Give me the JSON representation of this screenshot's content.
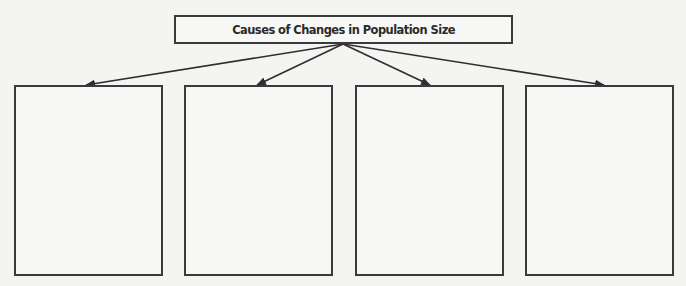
{
  "diagram": {
    "title": "Causes of Changes in Population Size",
    "colors": {
      "background": "#f4f4f2",
      "stroke": "#3a3a3a",
      "text": "#2a2a2a"
    },
    "boxes": [
      {
        "label": ""
      },
      {
        "label": ""
      },
      {
        "label": ""
      },
      {
        "label": ""
      }
    ]
  }
}
